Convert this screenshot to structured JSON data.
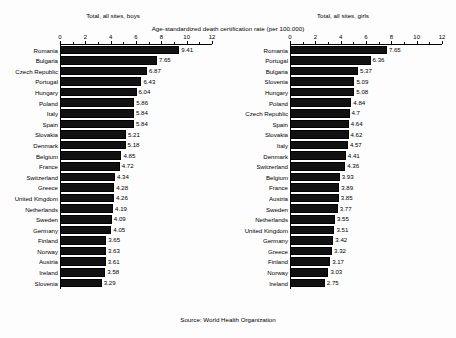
{
  "axis_super_title": "Age-standardized death certification rate (per 100.000)",
  "source_note": "Source: World Health Organization",
  "panels": [
    {
      "title": "Total, all sites, boys"
    },
    {
      "title": "Total, all sites, girls"
    }
  ],
  "chart_data": [
    {
      "type": "bar",
      "orientation": "horizontal",
      "title": "Total, all sites, boys",
      "xlabel": "Age-standardized death certification rate (per 100.000)",
      "ylabel": "",
      "xlim": [
        0,
        12
      ],
      "xticks": [
        0,
        2,
        4,
        6,
        8,
        10,
        12
      ],
      "grid": false,
      "legend": null,
      "source": "Source: World Health Organization",
      "categories": [
        "Romania",
        "Bulgaria",
        "Czech Republic",
        "Portugal",
        "Hungary",
        "Poland",
        "Italy",
        "Spain",
        "Slovakia",
        "Denmark",
        "Belgium",
        "France",
        "Switzerland",
        "Greece",
        "United Kingdom",
        "Netherlands",
        "Sweden",
        "Germany",
        "Finland",
        "Norway",
        "Austria",
        "Ireland",
        "Slovenia"
      ],
      "values": [
        9.41,
        7.65,
        6.87,
        6.43,
        6.04,
        5.86,
        5.84,
        5.84,
        5.21,
        5.18,
        4.85,
        4.72,
        4.34,
        4.28,
        4.26,
        4.19,
        4.09,
        4.05,
        3.65,
        3.63,
        3.61,
        3.58,
        3.29
      ],
      "value_labels": [
        "9.41",
        "7.65",
        "6.87",
        "6.43",
        "6.04",
        "5.86",
        "5.84",
        "5.84",
        "5.21",
        "5.18",
        "4.85",
        "4.72",
        "4.34",
        "4.28",
        "4.26",
        "4.19",
        "4.09",
        "4.05",
        "3.65",
        "3.63",
        "3.61",
        "3.58",
        "3.29"
      ]
    },
    {
      "type": "bar",
      "orientation": "horizontal",
      "title": "Total, all sites, girls",
      "xlabel": "Age-standardized death certification rate (per 100.000)",
      "ylabel": "",
      "xlim": [
        0,
        12
      ],
      "xticks": [
        0,
        2,
        4,
        6,
        8,
        10,
        12
      ],
      "grid": false,
      "legend": null,
      "source": "Source: World Health Organization",
      "categories": [
        "Romania",
        "Portugal",
        "Bulgaria",
        "Slovenia",
        "Hungary",
        "Poland",
        "Czech Republic",
        "Spain",
        "Slovakia",
        "Italy",
        "Denmark",
        "Switzerland",
        "Belgium",
        "France",
        "Austria",
        "Sweden",
        "Netherlands",
        "United Kingdom",
        "Germany",
        "Greece",
        "Finland",
        "Norway",
        "Ireland"
      ],
      "values": [
        7.65,
        6.36,
        5.37,
        5.09,
        5.08,
        4.84,
        4.7,
        4.64,
        4.62,
        4.57,
        4.41,
        4.36,
        3.93,
        3.89,
        3.85,
        3.77,
        3.55,
        3.51,
        3.42,
        3.32,
        3.17,
        3.03,
        2.75
      ],
      "value_labels": [
        "7.65",
        "6.36",
        "5.37",
        "5.09",
        "5.08",
        "4.84",
        "4.7",
        "4.64",
        "4.62",
        "4.57",
        "4.41",
        "4.36",
        "3.93",
        "3.89",
        "3.85",
        "3.77",
        "3.55",
        "3.51",
        "3.42",
        "3.32",
        "3.17",
        "3.03",
        "2.75"
      ]
    }
  ]
}
